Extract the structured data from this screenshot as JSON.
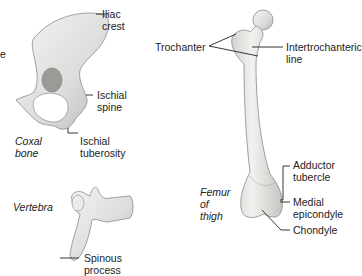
{
  "diagram": {
    "edge_fragment": "e",
    "coxal_bone": {
      "title": [
        "Coxal",
        "bone"
      ],
      "labels": {
        "iliac_crest": [
          "Iliac",
          "crest"
        ],
        "ischial_spine": [
          "Ischial",
          "spine"
        ],
        "ischial_tuberosity": [
          "Ischial",
          "tuberosity"
        ]
      }
    },
    "vertebra": {
      "title": "Vertebra",
      "labels": {
        "spinous_process": [
          "Spinous",
          "process"
        ]
      }
    },
    "femur": {
      "title": [
        "Femur",
        "of",
        "thigh"
      ],
      "labels": {
        "trochanter": "Trochanter",
        "intertrochanteric_line": [
          "Intertrochanteric",
          "line"
        ],
        "adductor_tubercle": [
          "Adductor",
          "tubercle"
        ],
        "medial_epicondyle": [
          "Medial",
          "epicondyle"
        ],
        "chondyle": "Chondyle"
      }
    },
    "colors": {
      "bone_fill": "#e6e6e4",
      "bone_shade": "#bdbdba",
      "bone_stroke": "#8a8a88",
      "leader": "#222222"
    }
  }
}
